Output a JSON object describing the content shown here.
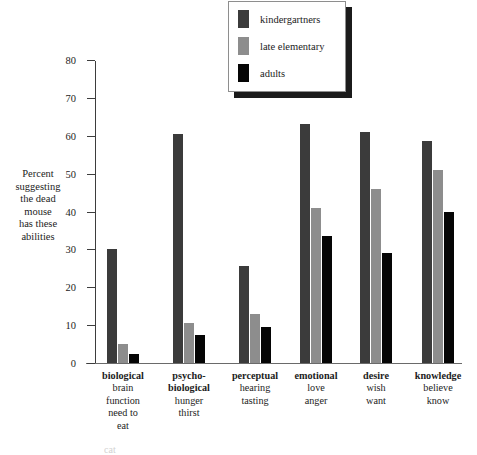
{
  "chart_data": {
    "type": "bar",
    "title": "",
    "xlabel": "",
    "ylabel": "Percent suggesting the dead mouse has these abilities",
    "ylim": [
      0,
      80
    ],
    "yticks": [
      0,
      10,
      20,
      30,
      40,
      50,
      60,
      70,
      80
    ],
    "grid": false,
    "legend_position": "top-center",
    "categories": [
      "biological",
      "psycho-biological",
      "perceptual",
      "emotional",
      "desire",
      "knowledge"
    ],
    "category_labels": [
      {
        "head": [
          "biological"
        ],
        "sub": [
          "brain",
          "function",
          "need to",
          "eat"
        ]
      },
      {
        "head": [
          "psycho-",
          "biological"
        ],
        "sub": [
          "hunger",
          "thirst"
        ]
      },
      {
        "head": [
          "perceptual"
        ],
        "sub": [
          "hearing",
          "tasting"
        ]
      },
      {
        "head": [
          "emotional"
        ],
        "sub": [
          "love",
          "anger"
        ]
      },
      {
        "head": [
          "desire"
        ],
        "sub": [
          "wish",
          "want"
        ]
      },
      {
        "head": [
          "knowledge"
        ],
        "sub": [
          "believe",
          "know"
        ]
      }
    ],
    "series": [
      {
        "name": "kindergartners",
        "color": "#3b3b3b",
        "values": [
          30,
          60.5,
          25.5,
          63,
          61,
          58.5
        ]
      },
      {
        "name": "late elementary",
        "color": "#8d8d8d",
        "values": [
          5,
          10.5,
          13,
          41,
          46,
          51
        ]
      },
      {
        "name": "adults",
        "color": "#050505",
        "values": [
          2.5,
          7.5,
          9.5,
          33.5,
          29,
          40
        ]
      }
    ]
  },
  "y_axis": {
    "title_lines": [
      "Percent",
      "suggesting",
      "the dead",
      "mouse",
      "has these",
      "abilities"
    ],
    "ticks": [
      "80",
      "70",
      "60",
      "50",
      "40",
      "30",
      "20",
      "10",
      "0"
    ]
  },
  "legend": {
    "items": [
      {
        "label": "kindergartners",
        "color": "#3b3b3b"
      },
      {
        "label": "late elementary",
        "color": "#8d8d8d"
      },
      {
        "label": "adults",
        "color": "#050505"
      }
    ]
  },
  "footer": {
    "caption": "cat"
  }
}
